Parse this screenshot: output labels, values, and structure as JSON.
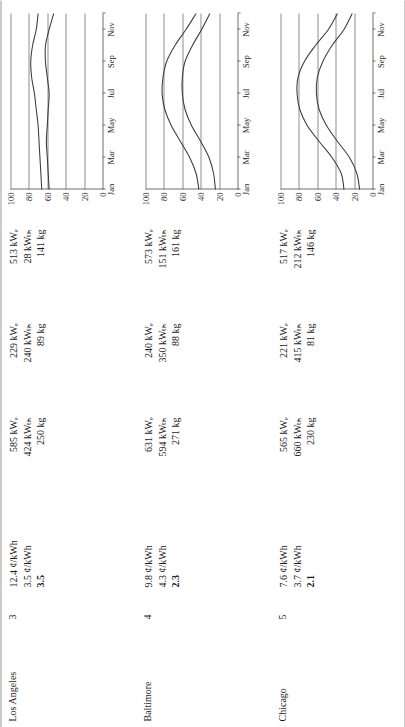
{
  "table": {
    "rows": [
      {
        "city": "Los Angeles",
        "rank": "3",
        "electric_rate": "12.4 ¢/kWh",
        "gas_rate": "3.5 ¢/kWh",
        "ratio": "3.5",
        "systems": [
          {
            "elec": "585 kWₑ",
            "therm": "424 kWₜₕ",
            "mass": "250 kg"
          },
          {
            "elec": "229 kWₑ",
            "therm": "240 kWₜₕ",
            "mass": "89 kg"
          },
          {
            "elec": "513 kWₑ",
            "therm": "28 kWₜₕ",
            "mass": "141 kg"
          }
        ]
      },
      {
        "city": "Baltimore",
        "rank": "4",
        "electric_rate": "9.8 ¢/kWh",
        "gas_rate": "4.3 ¢/kWh",
        "ratio": "2.3",
        "systems": [
          {
            "elec": "631 kWₑ",
            "therm": "594 kWₜₕ",
            "mass": "271 kg"
          },
          {
            "elec": "240 kWₑ",
            "therm": "350 kWₜₕ",
            "mass": "88 kg"
          },
          {
            "elec": "573 kWₑ",
            "therm": "151 kWₜₕ",
            "mass": "161 kg"
          }
        ]
      },
      {
        "city": "Chicago",
        "rank": "5",
        "electric_rate": "7.6 ¢/kWh",
        "gas_rate": "3.7 ¢/kWh",
        "ratio": "2.1",
        "systems": [
          {
            "elec": "565 kWₑ",
            "therm": "660 kWₜₕ",
            "mass": "230 kg"
          },
          {
            "elec": "221 kWₑ",
            "therm": "415 kWₜₕ",
            "mass": "81 kg"
          },
          {
            "elec": "517 kWₑ",
            "therm": "212 kWₜₕ",
            "mass": "146 kg"
          }
        ]
      }
    ]
  },
  "chart_data": [
    {
      "type": "line",
      "title": "Los Angeles monthly profile",
      "xlabel": "",
      "ylabel": "",
      "x": [
        "Jan",
        "Feb",
        "Mar",
        "Apr",
        "May",
        "Jun",
        "Jul",
        "Aug",
        "Sep",
        "Oct",
        "Nov",
        "Dec"
      ],
      "xtick_labels": [
        "Jan",
        "Mar",
        "May",
        "Jul",
        "Sep",
        "Nov"
      ],
      "ytick_labels": [
        "0",
        "20",
        "40",
        "60",
        "80",
        "100"
      ],
      "ylim": [
        0,
        100
      ],
      "grid": true,
      "legend": "none",
      "series": [
        {
          "name": "upper",
          "values": [
            66,
            67,
            68,
            69,
            70,
            72,
            74,
            77,
            78,
            76,
            72,
            70
          ]
        },
        {
          "name": "lower",
          "values": [
            58,
            59,
            60,
            61,
            60,
            59,
            58,
            60,
            62,
            62,
            58,
            53
          ]
        }
      ]
    },
    {
      "type": "line",
      "title": "Baltimore monthly profile",
      "xlabel": "",
      "ylabel": "",
      "x": [
        "Jan",
        "Feb",
        "Mar",
        "Apr",
        "May",
        "Jun",
        "Jul",
        "Aug",
        "Sep",
        "Oct",
        "Nov",
        "Dec"
      ],
      "xtick_labels": [
        "Jan",
        "Mar",
        "May",
        "Jul",
        "Sep",
        "Nov"
      ],
      "ytick_labels": [
        "0",
        "20",
        "40",
        "60",
        "80",
        "100"
      ],
      "ylim": [
        0,
        100
      ],
      "grid": true,
      "legend": "none",
      "series": [
        {
          "name": "upper",
          "values": [
            42,
            45,
            52,
            62,
            72,
            79,
            82,
            81,
            77,
            68,
            56,
            45
          ]
        },
        {
          "name": "lower",
          "values": [
            24,
            26,
            31,
            40,
            50,
            57,
            60,
            60,
            57,
            49,
            39,
            30
          ]
        }
      ]
    },
    {
      "type": "line",
      "title": "Chicago monthly profile",
      "xlabel": "",
      "ylabel": "",
      "x": [
        "Jan",
        "Feb",
        "Mar",
        "Apr",
        "May",
        "Jun",
        "Jul",
        "Aug",
        "Sep",
        "Oct",
        "Nov",
        "Dec"
      ],
      "xtick_labels": [
        "Jan",
        "Mar",
        "May",
        "Jul",
        "Sep",
        "Nov"
      ],
      "ytick_labels": [
        "0",
        "20",
        "40",
        "60",
        "80",
        "100"
      ],
      "ylim": [
        0,
        100
      ],
      "grid": true,
      "legend": "none",
      "series": [
        {
          "name": "upper",
          "values": [
            31,
            34,
            44,
            58,
            71,
            79,
            82,
            81,
            74,
            62,
            48,
            38
          ]
        },
        {
          "name": "lower",
          "values": [
            14,
            17,
            25,
            38,
            50,
            58,
            61,
            60,
            54,
            44,
            31,
            22
          ]
        }
      ]
    }
  ]
}
